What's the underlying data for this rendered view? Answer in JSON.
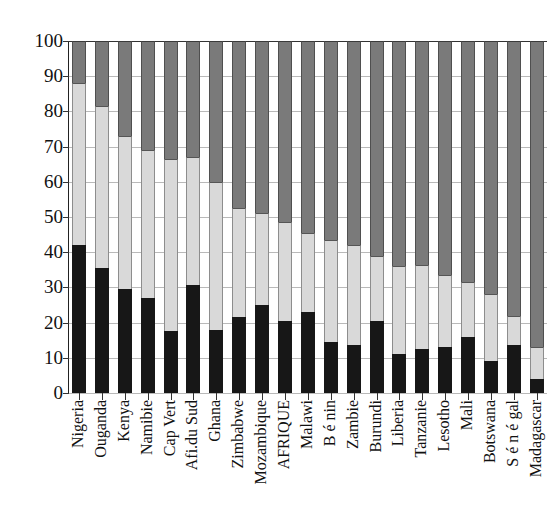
{
  "chart_data": {
    "type": "bar",
    "stacked": true,
    "title": "",
    "xlabel": "",
    "ylabel": "",
    "ylim": [
      0,
      100
    ],
    "yticks": [
      0,
      10,
      20,
      30,
      40,
      50,
      60,
      70,
      80,
      90,
      100
    ],
    "grid": true,
    "legend": "none",
    "categories": [
      "Nigeria",
      "Ouganda",
      "Kenya",
      "Namibie",
      "Cap Vert",
      "Afi.du Sud",
      "Ghana",
      "Zimbabwe",
      "Mozambique",
      "AFRIQUE",
      "Malawi",
      "B é nin",
      "Zambie",
      "Burundi",
      "Liberia",
      "Tanzanie",
      "Lesotho",
      "Mali",
      "Botswana",
      "S é n é gal",
      "Madagascar"
    ],
    "series": [
      {
        "name": "series-1",
        "color": "#171717",
        "values": [
          42,
          35.5,
          29.5,
          27,
          17.5,
          30.7,
          18,
          21.5,
          25,
          20.5,
          23,
          14.5,
          13.5,
          20.5,
          11,
          12.5,
          13,
          16,
          9,
          13.5,
          4
        ]
      },
      {
        "name": "series-2",
        "color": "#d9d9d9",
        "values": [
          46,
          46,
          43.5,
          42,
          49,
          36.3,
          42,
          31,
          26,
          28,
          22.5,
          29,
          28.5,
          18.5,
          25,
          24,
          20.5,
          15.5,
          19,
          8.5,
          9
        ]
      },
      {
        "name": "series-3",
        "color": "#7a7a7a",
        "values": [
          12,
          18.5,
          27,
          31,
          33.5,
          33,
          40,
          47.5,
          49,
          51.5,
          54.5,
          56.5,
          58,
          61,
          64,
          63.5,
          66.5,
          68.5,
          72,
          78,
          87
        ]
      }
    ],
    "cumulative_tops": {
      "series_1_top": [
        42,
        35.5,
        29.5,
        27,
        17.5,
        30.7,
        18,
        21.5,
        25,
        20.5,
        23,
        14.5,
        13.5,
        20.5,
        11,
        12.5,
        13,
        16,
        9,
        13.5,
        4
      ],
      "series_2_top": [
        88,
        81.5,
        73,
        69,
        66.5,
        67,
        60,
        52.5,
        51,
        48.5,
        45.5,
        43.5,
        42,
        39,
        36,
        36.5,
        33.5,
        31.5,
        28,
        22,
        13
      ],
      "series_3_top": [
        100,
        100,
        100,
        100,
        100,
        100,
        100,
        100,
        100,
        100,
        100,
        100,
        100,
        100,
        100,
        100,
        100,
        100,
        100,
        100,
        100
      ]
    }
  }
}
